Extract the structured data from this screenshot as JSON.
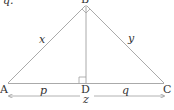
{
  "diagram": {
    "type": "right-triangle-altitude",
    "partial_text_top_left": "q.",
    "vertices": {
      "A": {
        "label": "A",
        "x": 8,
        "y": 84
      },
      "B": {
        "label": "B",
        "x": 86,
        "y": 6
      },
      "C": {
        "label": "C",
        "x": 164,
        "y": 84
      },
      "D": {
        "label": "D",
        "x": 86,
        "y": 84
      }
    },
    "side_labels": {
      "AB": "x",
      "BC": "y",
      "AD": "p",
      "DC": "q",
      "AC": "z"
    },
    "right_angles": [
      "B",
      "D"
    ],
    "colors": {
      "line": "#999999",
      "text": "#333333"
    }
  }
}
